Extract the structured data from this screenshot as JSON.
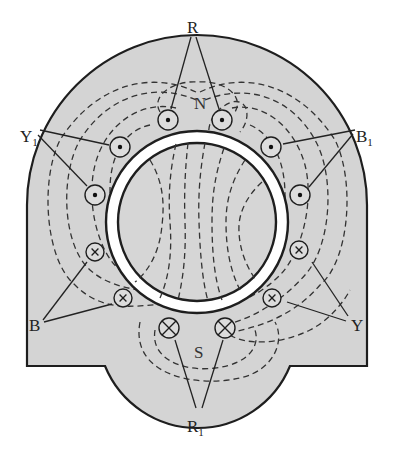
{
  "diagram": {
    "colors": {
      "stator_fill": "#d4d4d4",
      "rotor_fill": "#d6d6d6",
      "air_gap": "#ffffff",
      "outline": "#1e1e1e",
      "flux_line": "#333333",
      "leader_line": "#222222"
    },
    "rotor": {
      "cx": 197,
      "cy": 222,
      "outer_r": 91,
      "inner_r": 79
    },
    "poles": [
      {
        "id": "north",
        "label": "N",
        "x": 200,
        "y": 103
      },
      {
        "id": "south",
        "label": "S",
        "x": 200,
        "y": 352
      }
    ],
    "phase_labels": [
      {
        "id": "R",
        "text": "R",
        "sub": "",
        "x": 191,
        "y": 30
      },
      {
        "id": "Y1",
        "text": "Y",
        "sub": "1",
        "x": 20,
        "y": 137
      },
      {
        "id": "B1",
        "text": "B",
        "sub": "1",
        "x": 363,
        "y": 137
      },
      {
        "id": "B",
        "text": "B",
        "sub": "",
        "x": 28,
        "y": 326
      },
      {
        "id": "Y",
        "text": "Y",
        "sub": "",
        "x": 350,
        "y": 326
      },
      {
        "id": "R1",
        "text": "R",
        "sub": "1",
        "x": 187,
        "y": 434
      }
    ],
    "conductors": [
      {
        "phase": "R",
        "type": "dot",
        "x": 168,
        "y": 120,
        "r": 10
      },
      {
        "phase": "R",
        "type": "dot",
        "x": 222,
        "y": 120,
        "r": 10
      },
      {
        "phase": "Y1",
        "type": "dot",
        "x": 120,
        "y": 147,
        "r": 10
      },
      {
        "phase": "Y1",
        "type": "dot",
        "x": 95,
        "y": 195,
        "r": 10
      },
      {
        "phase": "B1",
        "type": "dot",
        "x": 271,
        "y": 147,
        "r": 10
      },
      {
        "phase": "B1",
        "type": "dot",
        "x": 300,
        "y": 195,
        "r": 10
      },
      {
        "phase": "B",
        "type": "cross",
        "x": 95,
        "y": 252,
        "r": 9
      },
      {
        "phase": "B",
        "type": "cross",
        "x": 123,
        "y": 298,
        "r": 9
      },
      {
        "phase": "Y",
        "type": "cross",
        "x": 299,
        "y": 250,
        "r": 9
      },
      {
        "phase": "Y",
        "type": "cross",
        "x": 272,
        "y": 298,
        "r": 9
      },
      {
        "phase": "R1",
        "type": "cross-large",
        "x": 169,
        "y": 328,
        "r": 10
      },
      {
        "phase": "R1",
        "type": "cross-large",
        "x": 225,
        "y": 328,
        "r": 10
      }
    ],
    "leaders": [
      {
        "from": [
          191,
          37
        ],
        "to": [
          171,
          109
        ]
      },
      {
        "from": [
          196,
          37
        ],
        "to": [
          219,
          109
        ]
      },
      {
        "from": [
          40,
          130
        ],
        "to": [
          109,
          145
        ]
      },
      {
        "from": [
          38,
          135
        ],
        "to": [
          87,
          186
        ]
      },
      {
        "from": [
          355,
          130
        ],
        "to": [
          283,
          144
        ]
      },
      {
        "from": [
          353,
          134
        ],
        "to": [
          309,
          187
        ]
      },
      {
        "from": [
          43,
          320
        ],
        "to": [
          87,
          262
        ]
      },
      {
        "from": [
          44,
          322
        ],
        "to": [
          112,
          304
        ]
      },
      {
        "from": [
          348,
          316
        ],
        "to": [
          312,
          262
        ]
      },
      {
        "from": [
          346,
          321
        ],
        "to": [
          287,
          302
        ]
      },
      {
        "from": [
          196,
          408
        ],
        "to": [
          175,
          340
        ]
      },
      {
        "from": [
          202,
          408
        ],
        "to": [
          223,
          340
        ]
      }
    ]
  }
}
